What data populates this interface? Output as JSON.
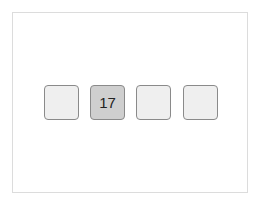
{
  "board": {
    "tiles": [
      {
        "value": "",
        "active": false
      },
      {
        "value": "17",
        "active": true
      },
      {
        "value": "",
        "active": false
      },
      {
        "value": "",
        "active": false
      }
    ]
  },
  "colors": {
    "tile_bg": "#efefef",
    "tile_active_bg": "#cfcfcf",
    "tile_border": "#8a8a8a",
    "frame_border": "#dcdcdc"
  }
}
